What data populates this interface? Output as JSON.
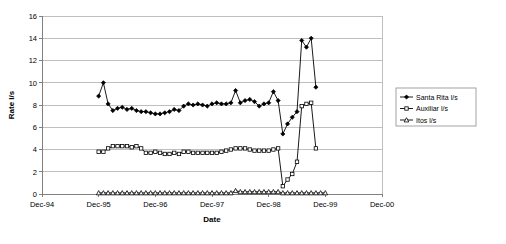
{
  "chart_data": {
    "type": "line",
    "title": "",
    "xlabel": "Date",
    "ylabel": "Rate l/s",
    "ylim": [
      0,
      16
    ],
    "ytick_step": 2,
    "yticks": [
      "0",
      "2",
      "4",
      "6",
      "8",
      "10",
      "12",
      "14",
      "16"
    ],
    "xticks": [
      "Dec-94",
      "Dec-95",
      "Dec-96",
      "Dec-97",
      "Dec-98",
      "Dec-99",
      "Dec-00"
    ],
    "xlim_labels": [
      "Dec-94",
      "Dec-00"
    ],
    "grid": "horizontal",
    "legend_position": "right",
    "x_unit": "months since Dec-94",
    "x": [
      12,
      13,
      14,
      15,
      16,
      17,
      18,
      19,
      20,
      21,
      22,
      23,
      24,
      25,
      26,
      27,
      28,
      29,
      30,
      31,
      32,
      33,
      34,
      35,
      36,
      37,
      38,
      39,
      40,
      41,
      42,
      43,
      44,
      45,
      46,
      47,
      48,
      49,
      50,
      51,
      52,
      53,
      54,
      55,
      56,
      57,
      58,
      59,
      60
    ],
    "series": [
      {
        "name": "Santa Rita l/s",
        "marker": "filled-diamond",
        "color": "#000000",
        "values": [
          8.8,
          10.0,
          8.1,
          7.5,
          7.7,
          7.8,
          7.6,
          7.7,
          7.5,
          7.4,
          7.4,
          7.3,
          7.2,
          7.2,
          7.3,
          7.4,
          7.6,
          7.5,
          7.9,
          8.1,
          8.0,
          8.1,
          8.0,
          7.9,
          8.1,
          8.2,
          8.1,
          8.1,
          8.2,
          9.3,
          8.2,
          8.4,
          8.5,
          8.3,
          7.9,
          8.1,
          8.2,
          9.2,
          8.4,
          5.4,
          6.3,
          6.9,
          7.4,
          13.8,
          13.2,
          14.0,
          9.6,
          null,
          null
        ]
      },
      {
        "name": "Auxiliar l/s",
        "marker": "open-square",
        "color": "#000000",
        "values": [
          3.8,
          3.8,
          4.1,
          4.3,
          4.3,
          4.3,
          4.3,
          4.2,
          4.3,
          4.1,
          3.7,
          3.7,
          3.8,
          3.7,
          3.6,
          3.6,
          3.7,
          3.6,
          3.8,
          3.8,
          3.7,
          3.7,
          3.7,
          3.7,
          3.7,
          3.7,
          3.8,
          3.9,
          4.0,
          4.1,
          4.1,
          4.1,
          4.0,
          3.9,
          3.9,
          3.9,
          3.9,
          4.0,
          4.1,
          0.7,
          1.3,
          1.8,
          2.9,
          7.9,
          8.1,
          8.2,
          4.1,
          null,
          null
        ]
      },
      {
        "name": "Itos l/s",
        "marker": "open-triangle",
        "color": "#000000",
        "values": [
          0.1,
          0.1,
          0.1,
          0.1,
          0.1,
          0.1,
          0.1,
          0.1,
          0.1,
          0.1,
          0.1,
          0.1,
          0.1,
          0.1,
          0.1,
          0.1,
          0.1,
          0.1,
          0.1,
          0.1,
          0.1,
          0.1,
          0.1,
          0.1,
          0.1,
          0.1,
          0.1,
          0.1,
          0.1,
          0.3,
          0.2,
          0.2,
          0.2,
          0.2,
          0.2,
          0.2,
          0.2,
          0.2,
          0.2,
          0.1,
          0.1,
          0.1,
          0.1,
          0.1,
          0.1,
          0.1,
          0.1,
          0.1,
          0.1
        ]
      }
    ]
  },
  "legend": {
    "items": [
      {
        "label": "Santa Rita l/s",
        "marker": "filled-diamond"
      },
      {
        "label": "Auxiliar l/s",
        "marker": "open-square"
      },
      {
        "label": "Itos l/s",
        "marker": "open-triangle"
      }
    ]
  }
}
